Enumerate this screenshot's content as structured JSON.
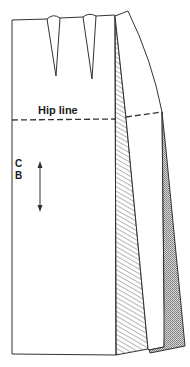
{
  "diagram": {
    "type": "skirt-pattern-draft",
    "labels": {
      "hip_line": "Hip line",
      "centre_back_c": "C",
      "centre_back_b": "B"
    },
    "pieces": [
      {
        "name": "back-panel",
        "fill": "none"
      },
      {
        "name": "hatched-wedge",
        "fill": "hatched"
      },
      {
        "name": "side-panel",
        "fill": "none"
      },
      {
        "name": "stippled-wedge",
        "fill": "stippled"
      }
    ],
    "darts": 2,
    "grain_arrow": "vertical double-headed",
    "colors": {
      "line": "#333333",
      "background": "#ffffff",
      "stipple": "#9a9a9a"
    }
  }
}
